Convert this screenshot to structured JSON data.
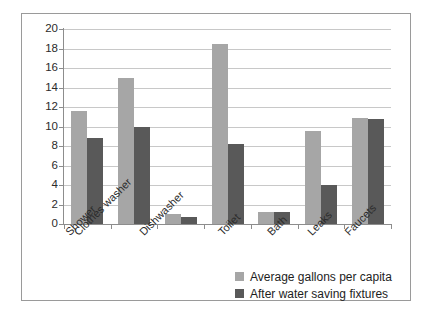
{
  "chart_data": {
    "type": "bar",
    "title": "",
    "subtitle": "",
    "xlabel": "",
    "ylabel": "",
    "ylim": [
      0,
      20
    ],
    "ytick_step": 2,
    "yticks": [
      20,
      18,
      16,
      14,
      12,
      10,
      8,
      6,
      4,
      2,
      0
    ],
    "grid": true,
    "legend_position": "bottom-right",
    "categories": [
      "Shower",
      "Clothes washer",
      "Dishwasher",
      "Toilet",
      "Bath",
      "Leaks",
      "Faucets"
    ],
    "series": [
      {
        "name": "Average gallons per capita",
        "color": "#a6a6a6",
        "values": [
          11.6,
          15.0,
          1.0,
          18.5,
          1.2,
          9.5,
          10.9
        ]
      },
      {
        "name": "After water saving fixtures",
        "color": "#595959",
        "values": [
          8.8,
          10.0,
          0.7,
          8.2,
          1.2,
          4.0,
          10.8
        ]
      }
    ]
  },
  "legend": {
    "items": [
      {
        "label": "Average gallons per capita",
        "swatch": "light-gray-swatch"
      },
      {
        "label": "After water saving fixtures",
        "swatch": "dark-gray-swatch"
      }
    ]
  },
  "colors": {
    "series_a": "#a6a6a6",
    "series_b": "#595959",
    "gridline": "#c8c8c8",
    "axis": "#8d8d8d",
    "frame": "#9a9a9a",
    "text": "#2b2b2b",
    "background": "#ffffff"
  }
}
